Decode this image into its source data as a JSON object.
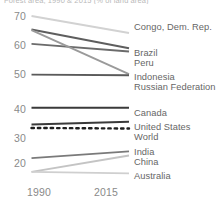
{
  "title_partial": "Forest area, 1990 & 2015 (% of land area)",
  "chart_data": {
    "type": "line",
    "title": "Forest area, 1990 & 2015 (% of land area)",
    "xlabel": "",
    "ylabel": "",
    "x": [
      1990,
      2015
    ],
    "xtick_labels": [
      "1990",
      "2015"
    ],
    "ytick_labels": [
      "70",
      "60",
      "50",
      "40",
      "30",
      "20"
    ],
    "yticks": [
      70,
      60,
      50,
      40,
      30,
      20
    ],
    "ylim": [
      14,
      72
    ],
    "xlim": [
      1990,
      2015
    ],
    "grid": false,
    "legend_position": "right-inline-labels",
    "series": [
      {
        "name": "Congo, Dem. Rep.",
        "values": [
          70.0,
          64.2
        ],
        "color": "#d2d2d2",
        "style": "solid",
        "width": 1.9
      },
      {
        "name": "Brazil",
        "values": [
          65.4,
          59.0
        ],
        "color": "#5e5e5e",
        "style": "solid",
        "width": 1.9
      },
      {
        "name": "Peru",
        "values": [
          60.5,
          57.9
        ],
        "color": "#6b6b6b",
        "style": "solid",
        "width": 1.9
      },
      {
        "name": "Indonesia",
        "values": [
          65.2,
          50.2
        ],
        "color": "#9a9a9a",
        "style": "solid",
        "width": 1.9
      },
      {
        "name": "Russian Federation",
        "values": [
          50.0,
          49.8
        ],
        "color": "#5a5a5a",
        "style": "solid",
        "width": 1.9
      },
      {
        "name": "Canada",
        "values": [
          38.7,
          38.7
        ],
        "color": "#3a3a3a",
        "style": "solid",
        "width": 2.0
      },
      {
        "name": "United States",
        "values": [
          33.0,
          33.9
        ],
        "color": "#3a3a3a",
        "style": "solid",
        "width": 2.0
      },
      {
        "name": "World",
        "values": [
          31.8,
          31.6
        ],
        "color": "#1f1f1f",
        "style": "dotted",
        "width": 2.4
      },
      {
        "name": "India",
        "values": [
          21.5,
          23.8
        ],
        "color": "#7a7a7a",
        "style": "solid",
        "width": 1.9
      },
      {
        "name": "China",
        "values": [
          16.8,
          22.4
        ],
        "color": "#c4c4c4",
        "style": "solid",
        "width": 1.9
      },
      {
        "name": "Australia",
        "values": [
          16.8,
          16.3
        ],
        "color": "#cfcfcf",
        "style": "solid",
        "width": 1.9
      }
    ]
  },
  "yaxis": {
    "ticks": [
      {
        "label": "70",
        "top": 10
      },
      {
        "label": "60",
        "top": 39
      },
      {
        "label": "50",
        "top": 68
      },
      {
        "label": "40",
        "top": 103
      },
      {
        "label": "30",
        "top": 132
      },
      {
        "label": "20",
        "top": 157
      }
    ]
  },
  "xaxis": {
    "ticks": [
      {
        "label": "1990",
        "left": 27
      },
      {
        "label": "2015",
        "left": 94
      }
    ]
  },
  "labels": [
    {
      "text": "Congo, Dem. Rep.",
      "left": 134,
      "top": 22
    },
    {
      "text": "Brazil",
      "left": 134,
      "top": 48
    },
    {
      "text": "Peru",
      "left": 134,
      "top": 58
    },
    {
      "text": "Indonesia",
      "left": 134,
      "top": 72
    },
    {
      "text": "Russian Federation",
      "left": 134,
      "top": 82
    },
    {
      "text": "Canada",
      "left": 134,
      "top": 108
    },
    {
      "text": "United States",
      "left": 134,
      "top": 122
    },
    {
      "text": "World",
      "left": 134,
      "top": 132
    },
    {
      "text": "India",
      "left": 134,
      "top": 147
    },
    {
      "text": "China",
      "left": 134,
      "top": 157
    },
    {
      "text": "Australia",
      "left": 134,
      "top": 171
    }
  ]
}
